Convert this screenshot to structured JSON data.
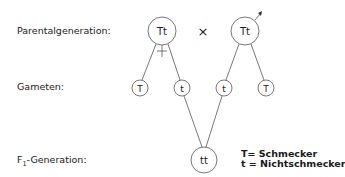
{
  "rows": {
    "parental": "Parentalgeneration:",
    "gametes": "Gameten:",
    "f1_prefix": "F",
    "f1_sub": "1",
    "f1_suffix": "-Generation:"
  },
  "parents": {
    "mother": "Tt",
    "father": "Tt",
    "cross_symbol": "×",
    "mother_symbol": "female-symbol",
    "father_symbol": "male-symbol"
  },
  "gametes": [
    "T",
    "t",
    "t",
    "T"
  ],
  "offspring": "tt",
  "legend": [
    "T= Schmecker",
    "t = Nichtschmecker"
  ],
  "colors": {
    "line": "#555555",
    "text": "#1a1a1a",
    "background": "#ffffff"
  }
}
